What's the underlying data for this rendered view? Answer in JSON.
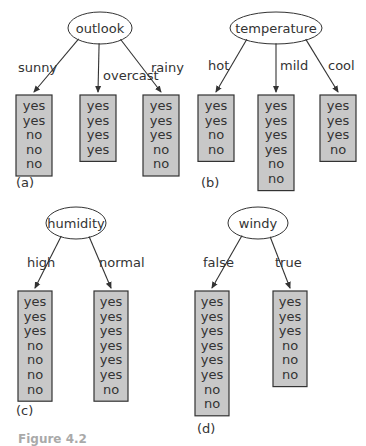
{
  "diagram": {
    "colors": {
      "leaf_fill": "#c8c8c8",
      "stroke": "#333333",
      "background": "#ffffff"
    },
    "panels": [
      {
        "label": "(a)",
        "attribute": "outlook",
        "branches": [
          {
            "value": "sunny",
            "leaf": [
              "yes",
              "yes",
              "no",
              "no",
              "no"
            ]
          },
          {
            "value": "overcast",
            "leaf": [
              "yes",
              "yes",
              "yes",
              "yes"
            ]
          },
          {
            "value": "rainy",
            "leaf": [
              "yes",
              "yes",
              "yes",
              "no",
              "no"
            ]
          }
        ]
      },
      {
        "label": "(b)",
        "attribute": "temperature",
        "branches": [
          {
            "value": "hot",
            "leaf": [
              "yes",
              "yes",
              "no",
              "no"
            ]
          },
          {
            "value": "mild",
            "leaf": [
              "yes",
              "yes",
              "yes",
              "yes",
              "no",
              "no"
            ]
          },
          {
            "value": "cool",
            "leaf": [
              "yes",
              "yes",
              "yes",
              "no"
            ]
          }
        ]
      },
      {
        "label": "(c)",
        "attribute": "humidity",
        "branches": [
          {
            "value": "high",
            "leaf": [
              "yes",
              "yes",
              "yes",
              "no",
              "no",
              "no",
              "no"
            ]
          },
          {
            "value": "normal",
            "leaf": [
              "yes",
              "yes",
              "yes",
              "yes",
              "yes",
              "yes",
              "no"
            ]
          }
        ]
      },
      {
        "label": "(d)",
        "attribute": "windy",
        "branches": [
          {
            "value": "false",
            "leaf": [
              "yes",
              "yes",
              "yes",
              "yes",
              "yes",
              "yes",
              "no",
              "no"
            ]
          },
          {
            "value": "true",
            "leaf": [
              "yes",
              "yes",
              "yes",
              "no",
              "no",
              "no"
            ]
          }
        ]
      }
    ],
    "caption": "Figure 4.2"
  }
}
